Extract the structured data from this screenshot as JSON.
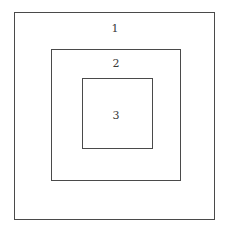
{
  "diagram": {
    "regions": [
      {
        "label": "1",
        "level": "outer"
      },
      {
        "label": "2",
        "level": "middle"
      },
      {
        "label": "3",
        "level": "inner"
      }
    ],
    "line_color": "#4a4a4a",
    "text_color": "#3a3a3a"
  }
}
